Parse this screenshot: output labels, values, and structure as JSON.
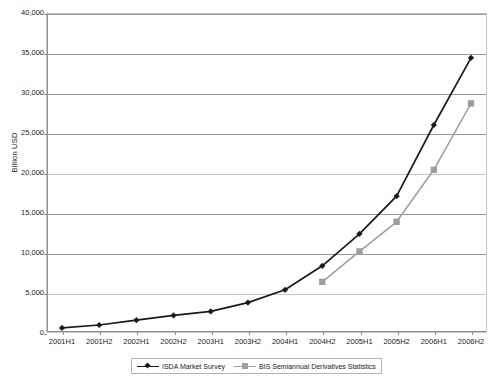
{
  "chart_data": {
    "type": "line",
    "title": "",
    "xlabel": "",
    "ylabel": "Billion USD",
    "ylim": [
      0,
      40000
    ],
    "ytick_step": 5000,
    "grid": true,
    "legend_position": "bottom",
    "categories": [
      "2001H1",
      "2001H2",
      "2002H1",
      "2002H2",
      "2003H1",
      "2003H2",
      "2004H1",
      "2004H2",
      "2005H1",
      "2005H2",
      "2006H1",
      "2006H2"
    ],
    "ytick_labels": [
      "0",
      "5,000",
      "10,000",
      "15,000",
      "20,000",
      "25,000",
      "30,000",
      "35,000",
      "40,000"
    ],
    "ytick_values": [
      0,
      5000,
      10000,
      15000,
      20000,
      25000,
      30000,
      35000,
      40000
    ],
    "series": [
      {
        "name": "ISDA Market Survey",
        "color": "#1a1a1a",
        "marker": "diamond",
        "values": [
          632,
          1000,
          1600,
          2200,
          2700,
          3800,
          5400,
          8400,
          12400,
          17100,
          26000,
          34400
        ]
      },
      {
        "name": "BIS Semiannual Derivatives Statistics",
        "color": "#9e9e9e",
        "marker": "square",
        "values": [
          null,
          null,
          null,
          null,
          null,
          null,
          null,
          6400,
          10200,
          13900,
          20400,
          28700
        ]
      }
    ]
  },
  "legend": {
    "entries": [
      {
        "label": "ISDA Market Survey"
      },
      {
        "label": "BIS Semiannual Derivatives Statistics"
      }
    ]
  }
}
